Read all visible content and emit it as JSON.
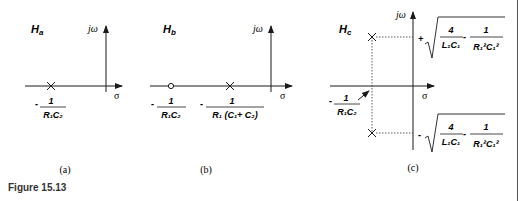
{
  "figure": {
    "caption": "Figure 15.13",
    "panels": [
      {
        "id": "a",
        "title_main": "H",
        "title_sub": "a",
        "label": "(a)",
        "axis_y": "jω",
        "axis_x": "σ",
        "poles": [
          {
            "label_num": "1",
            "label_den": "R₁C₂",
            "sign": "-"
          }
        ],
        "zeros": []
      },
      {
        "id": "b",
        "title_main": "H",
        "title_sub": "b",
        "label": "(b)",
        "axis_y": "jω",
        "axis_x": "σ",
        "zeros": [
          {
            "label_num": "1",
            "label_den": "R₁C₂",
            "sign": "-"
          }
        ],
        "poles": [
          {
            "label_num": "1",
            "label_den": "R₁ (C₁+ C₂)",
            "sign": "-"
          }
        ]
      },
      {
        "id": "c",
        "title_main": "H",
        "title_sub": "c",
        "label": "(c)",
        "axis_y": "jω",
        "axis_x": "σ",
        "real_part": {
          "label_num": "1",
          "label_den": "R₁C₂",
          "sign": "-"
        },
        "poles": [
          {
            "sign": "+",
            "term1_num": "4",
            "term1_den": "L₁C₁",
            "term2_num": "1",
            "term2_den": "R₁²C₁²"
          },
          {
            "sign": "-",
            "term1_num": "4",
            "term1_den": "L₁C₁",
            "term2_num": "1",
            "term2_den": "R₁²C₁²"
          }
        ]
      }
    ]
  }
}
